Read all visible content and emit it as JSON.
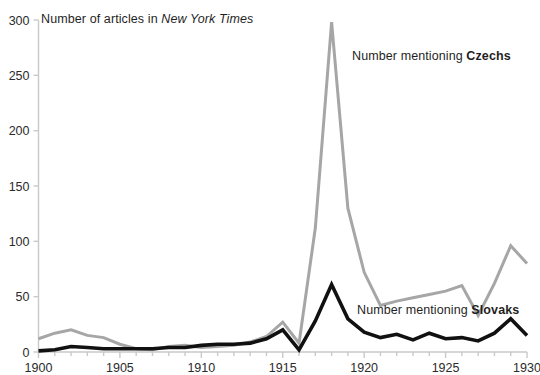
{
  "chart_data": {
    "type": "line",
    "title": "Number of articles in New York Times",
    "title_plain": "Number of articles in ",
    "title_publication": "New York Times",
    "xlabel": "",
    "ylabel": "",
    "xlim": [
      1900,
      1930
    ],
    "ylim": [
      0,
      300
    ],
    "yticks": [
      0,
      50,
      100,
      150,
      200,
      250,
      300
    ],
    "xticks": [
      1900,
      1905,
      1910,
      1915,
      1920,
      1925,
      1930
    ],
    "x_minor_tick_step": 1,
    "grid": false,
    "legend_position": "inline-annotations",
    "x": [
      1900,
      1901,
      1902,
      1903,
      1904,
      1905,
      1906,
      1907,
      1908,
      1909,
      1910,
      1911,
      1912,
      1913,
      1914,
      1915,
      1916,
      1917,
      1918,
      1919,
      1920,
      1921,
      1922,
      1923,
      1924,
      1925,
      1926,
      1927,
      1928,
      1929,
      1930
    ],
    "series": [
      {
        "name": "Czechs",
        "annotation_prefix": "Number mentioning ",
        "annotation_bold": "Czechs",
        "color": "#a6a6a6",
        "values": [
          12,
          17,
          20,
          15,
          13,
          7,
          3,
          2,
          5,
          6,
          4,
          5,
          6,
          9,
          14,
          27,
          8,
          112,
          298,
          130,
          72,
          42,
          46,
          49,
          52,
          55,
          60,
          33,
          62,
          96,
          80
        ]
      },
      {
        "name": "Slovaks",
        "annotation_prefix": "Number mentioning ",
        "annotation_bold": "Slovaks",
        "color": "#111111",
        "values": [
          1,
          2,
          5,
          4,
          3,
          3,
          3,
          3,
          4,
          4,
          6,
          7,
          7,
          8,
          12,
          20,
          2,
          28,
          61,
          30,
          18,
          13,
          16,
          11,
          17,
          12,
          13,
          10,
          17,
          30,
          15
        ]
      }
    ]
  },
  "axis": {
    "y_tick_labels": [
      "0",
      "50",
      "100",
      "150",
      "200",
      "250",
      "300"
    ],
    "x_tick_labels": [
      "1900",
      "1905",
      "1910",
      "1915",
      "1920",
      "1925",
      "1930"
    ]
  },
  "colors": {
    "czechs": "#a6a6a6",
    "slovaks": "#111111",
    "axis": "#c9c9c9",
    "text": "#1f1f1f",
    "background": "#ffffff"
  }
}
